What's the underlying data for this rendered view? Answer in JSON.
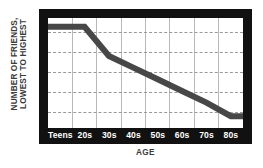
{
  "chart_data": {
    "type": "line",
    "title": "",
    "xlabel": "AGE",
    "ylabel_lines": [
      "NUMBER OF FRIENDS,",
      "LOWEST TO HIGHEST"
    ],
    "categories": [
      "Teens",
      "20s",
      "30s",
      "40s",
      "50s",
      "60s",
      "70s",
      "80s"
    ],
    "series": [
      {
        "name": "Number of friends",
        "values": [
          100,
          100,
          70,
          58,
          46,
          34,
          22,
          8
        ],
        "color": "#474747"
      }
    ],
    "ylim": [
      0,
      105
    ],
    "y_axis_ticks_labeled": false,
    "grid": {
      "horizontal_dashed_count": 5,
      "vertical_solid_count": 7,
      "horizontal_color": "#9a9a9a",
      "vertical_color": "#b9b9b9"
    },
    "legend_position": "none",
    "frame_color": "#111111",
    "plot_background": "#ffffff",
    "annotation": "Line is flat across Teens and 20s at its highest value, drops steeply from 20s to 30s, then declines steadily to its lowest value at 80s."
  }
}
